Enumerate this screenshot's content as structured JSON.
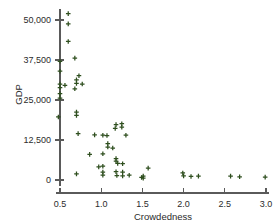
{
  "chart_data": {
    "type": "scatter",
    "title": "",
    "xlabel": "Crowdedness",
    "ylabel": "GDP",
    "xlim": [
      0.38,
      3.08
    ],
    "ylim": [
      -2200,
      54500
    ],
    "grid": false,
    "legend": null,
    "marker_style": "plus",
    "marker_color": "#33521f",
    "xticks": [
      0.5,
      1.0,
      1.5,
      2.0,
      2.5,
      3.0
    ],
    "xticklabels": [
      "0.5",
      "1.0",
      "1.5",
      "2.0",
      "2.5",
      "3.0"
    ],
    "yticks": [
      0,
      12500,
      25000,
      37500,
      50000
    ],
    "yticklabels": [
      "0",
      "12,500",
      "25,000",
      "37,500",
      "50,000"
    ],
    "points": [
      {
        "x": 0.6,
        "y": 52000
      },
      {
        "x": 0.6,
        "y": 48800
      },
      {
        "x": 0.6,
        "y": 43300
      },
      {
        "x": 0.68,
        "y": 38100
      },
      {
        "x": 0.5,
        "y": 37100
      },
      {
        "x": 0.5,
        "y": 34000
      },
      {
        "x": 0.73,
        "y": 32600
      },
      {
        "x": 0.7,
        "y": 31300
      },
      {
        "x": 0.5,
        "y": 30000
      },
      {
        "x": 0.56,
        "y": 29600
      },
      {
        "x": 0.7,
        "y": 30200
      },
      {
        "x": 0.77,
        "y": 30000
      },
      {
        "x": 0.5,
        "y": 28900
      },
      {
        "x": 0.68,
        "y": 28500
      },
      {
        "x": 0.5,
        "y": 27000
      },
      {
        "x": 0.5,
        "y": 25600
      },
      {
        "x": 0.7,
        "y": 21200
      },
      {
        "x": 0.7,
        "y": 20200
      },
      {
        "x": 0.48,
        "y": 19700
      },
      {
        "x": 1.18,
        "y": 17300
      },
      {
        "x": 1.25,
        "y": 17600
      },
      {
        "x": 1.25,
        "y": 16500
      },
      {
        "x": 1.17,
        "y": 16100
      },
      {
        "x": 0.72,
        "y": 14500
      },
      {
        "x": 0.92,
        "y": 14100
      },
      {
        "x": 1.02,
        "y": 14000
      },
      {
        "x": 1.07,
        "y": 13900
      },
      {
        "x": 1.3,
        "y": 14000
      },
      {
        "x": 1.08,
        "y": 11400
      },
      {
        "x": 1.08,
        "y": 10300
      },
      {
        "x": 1.14,
        "y": 10000
      },
      {
        "x": 0.86,
        "y": 8000
      },
      {
        "x": 1.02,
        "y": 8200
      },
      {
        "x": 1.18,
        "y": 6700
      },
      {
        "x": 1.18,
        "y": 5900
      },
      {
        "x": 1.2,
        "y": 5200
      },
      {
        "x": 1.26,
        "y": 5100
      },
      {
        "x": 0.97,
        "y": 4100
      },
      {
        "x": 1.02,
        "y": 4300
      },
      {
        "x": 1.57,
        "y": 3700
      },
      {
        "x": 1.02,
        "y": 2500
      },
      {
        "x": 1.18,
        "y": 2600
      },
      {
        "x": 1.26,
        "y": 2500
      },
      {
        "x": 0.7,
        "y": 1900
      },
      {
        "x": 1.02,
        "y": 1500
      },
      {
        "x": 1.19,
        "y": 1400
      },
      {
        "x": 1.26,
        "y": 1300
      },
      {
        "x": 1.34,
        "y": 1500
      },
      {
        "x": 1.49,
        "y": 800
      },
      {
        "x": 1.51,
        "y": 600
      },
      {
        "x": 1.51,
        "y": 1200
      },
      {
        "x": 1.99,
        "y": 2200
      },
      {
        "x": 2.0,
        "y": 1300
      },
      {
        "x": 2.09,
        "y": 1100
      },
      {
        "x": 2.18,
        "y": 1200
      },
      {
        "x": 2.57,
        "y": 1200
      },
      {
        "x": 2.68,
        "y": 1000
      },
      {
        "x": 2.99,
        "y": 900
      }
    ]
  }
}
